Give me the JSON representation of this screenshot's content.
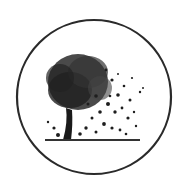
{
  "logo": {
    "description": "circular emblem with tree dispersing leaves",
    "colors": {
      "background": "#ffffff",
      "ring": "#2a2a2a",
      "tree": "#1e1e1e"
    }
  }
}
